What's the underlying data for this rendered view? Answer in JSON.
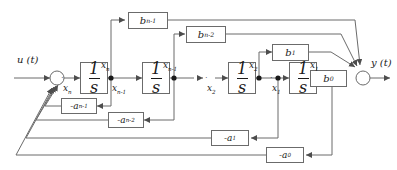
{
  "diagram": {
    "background": "#ffffff",
    "line_color": "#6b6b6b",
    "text_color": "#1a1a1a",
    "signals": {
      "input": "u (t)",
      "output": "y (t)",
      "state_n": "x",
      "state_n_sub": "n",
      "state_n1": "x",
      "state_n1_sub": "n-1",
      "state_2": "x",
      "state_2_sub": "2",
      "state_1": "x",
      "state_1_sub": "1",
      "dot_state_n": "x",
      "dot_state_n_sub": "n",
      "dot_state_n1": "x",
      "dot_state_n1_sub": "n-1",
      "dot_state_2": "x",
      "dot_state_2_sub": "2",
      "dot_state_1": "x",
      "dot_state_1_sub": "1",
      "ellipsis": "· · · ·"
    },
    "integrators": [
      {
        "id": "integrator-n",
        "numerator": "1",
        "denominator": "s"
      },
      {
        "id": "integrator-n-1",
        "numerator": "1",
        "denominator": "s"
      },
      {
        "id": "integrator-2",
        "numerator": "1",
        "denominator": "s"
      },
      {
        "id": "integrator-1",
        "numerator": "1",
        "denominator": "s"
      }
    ],
    "feedforward_gains": [
      {
        "id": "gain-b-n-1",
        "base": "b",
        "subscript": "n-1"
      },
      {
        "id": "gain-b-n-2",
        "base": "b",
        "subscript": "n-2"
      },
      {
        "id": "gain-b-1",
        "base": "b",
        "subscript": "1"
      },
      {
        "id": "gain-b-0",
        "base": "b",
        "subscript": "0"
      }
    ],
    "feedback_gains": [
      {
        "id": "gain-a-n-1",
        "base": "-a",
        "subscript": "n-1"
      },
      {
        "id": "gain-a-n-2",
        "base": "-a",
        "subscript": "n-2"
      },
      {
        "id": "gain-a-1",
        "base": "-a",
        "subscript": "1"
      },
      {
        "id": "gain-a-0",
        "base": "-a",
        "subscript": "0"
      }
    ],
    "summing_junctions": [
      {
        "id": "input-summer"
      },
      {
        "id": "output-summer"
      }
    ]
  }
}
